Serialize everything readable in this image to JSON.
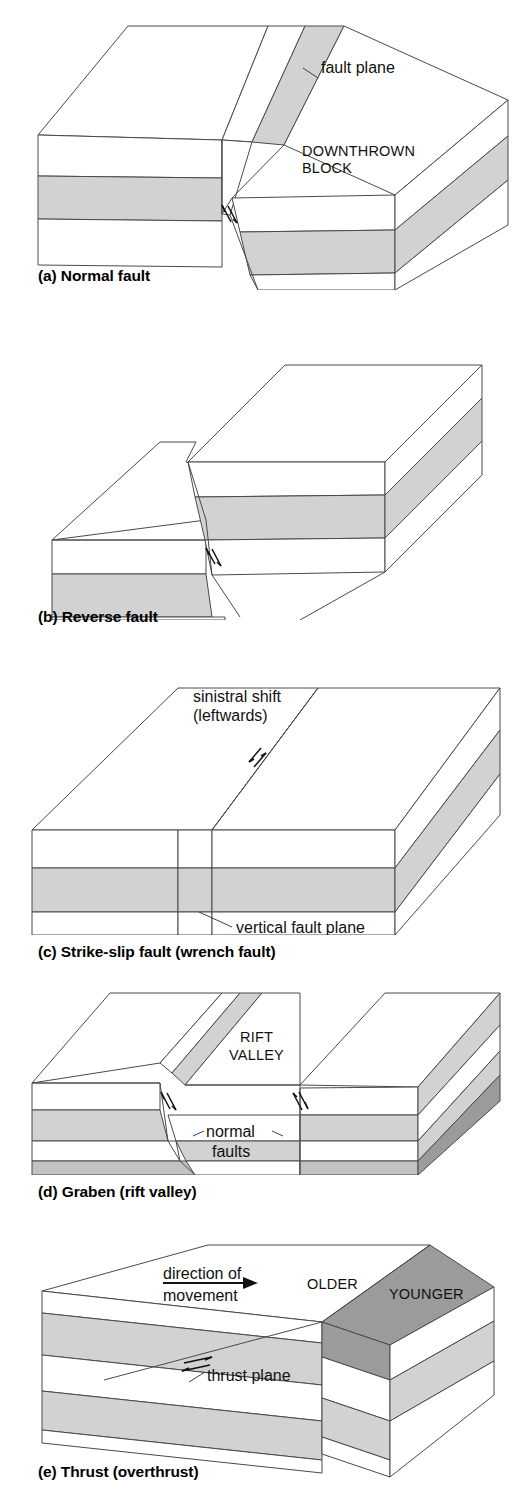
{
  "figure": {
    "colors": {
      "stratum_light": "#d2d2d2",
      "stratum_mid": "#c2c2c2",
      "stratum_dark": "#9b9b9b",
      "stratum_white": "#ffffff",
      "line": "#4a4a4a",
      "text": "#111111",
      "background": "#ffffff"
    },
    "panels": [
      {
        "id": "a",
        "caption": "(a) Normal fault",
        "annotations": [
          {
            "name": "fault-plane-label",
            "text": "fault plane",
            "style": "lower"
          },
          {
            "name": "downthrown-block-label-line1",
            "text": "DOWNTHROWN",
            "style": "caps"
          },
          {
            "name": "downthrown-block-label-line2",
            "text": "BLOCK",
            "style": "caps"
          }
        ],
        "slip_symbol": "normal-dip-slip-double-half-arrow"
      },
      {
        "id": "b",
        "caption": "(b) Reverse fault",
        "annotations": [],
        "slip_symbol": "reverse-dip-slip-double-half-arrow"
      },
      {
        "id": "c",
        "caption": "(c) Strike-slip fault (wrench fault)",
        "annotations": [
          {
            "name": "sinistral-shift-label-line1",
            "text": "sinistral shift",
            "style": "lower"
          },
          {
            "name": "sinistral-shift-label-line2",
            "text": "(leftwards)",
            "style": "lower"
          },
          {
            "name": "vertical-fault-plane-label",
            "text": "vertical fault plane",
            "style": "lower"
          }
        ],
        "slip_symbol": "strike-slip-double-half-arrow"
      },
      {
        "id": "d",
        "caption": "(d) Graben (rift valley)",
        "annotations": [
          {
            "name": "rift-valley-label-line1",
            "text": "RIFT",
            "style": "caps"
          },
          {
            "name": "rift-valley-label-line2",
            "text": "VALLEY",
            "style": "caps"
          },
          {
            "name": "normal-faults-label-line1",
            "text": "normal",
            "style": "lower"
          },
          {
            "name": "normal-faults-label-line2",
            "text": "faults",
            "style": "lower"
          }
        ],
        "slip_symbol": "paired-normal-dip-slip-arrows"
      },
      {
        "id": "e",
        "caption": "(e) Thrust (overthrust)",
        "annotations": [
          {
            "name": "direction-of-movement-label-line1",
            "text": "direction of",
            "style": "lower"
          },
          {
            "name": "direction-of-movement-label-line2",
            "text": "movement",
            "style": "lower"
          },
          {
            "name": "older-label",
            "text": "OLDER",
            "style": "caps"
          },
          {
            "name": "younger-label",
            "text": "YOUNGER",
            "style": "caps"
          },
          {
            "name": "thrust-plane-label",
            "text": "thrust plane",
            "style": "lower"
          }
        ],
        "slip_symbol": "thrust-horizontal-double-half-arrow"
      }
    ]
  }
}
